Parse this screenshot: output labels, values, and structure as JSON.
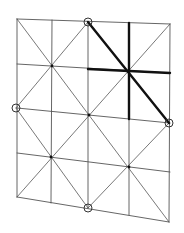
{
  "diagram": {
    "width": 184,
    "height": 233,
    "colors": {
      "background": "#ffffff",
      "thin_line": "#555555",
      "thick_line": "#111111",
      "marker": "#333333"
    },
    "grid_lines": [
      {
        "name": "row-0",
        "x1": 17,
        "y1": 19,
        "x2": 170,
        "y2": 24
      },
      {
        "name": "row-1",
        "x1": 17,
        "y1": 64,
        "x2": 170,
        "y2": 73
      },
      {
        "name": "row-2",
        "x1": 17,
        "y1": 108,
        "x2": 170,
        "y2": 123
      },
      {
        "name": "row-3",
        "x1": 17,
        "y1": 153,
        "x2": 170,
        "y2": 172
      },
      {
        "name": "row-4",
        "x1": 17,
        "y1": 197,
        "x2": 169,
        "y2": 222
      },
      {
        "name": "col-0",
        "x1": 17,
        "y1": 19,
        "x2": 17,
        "y2": 197
      },
      {
        "name": "col-1",
        "x1": 52,
        "y1": 20,
        "x2": 51,
        "y2": 203
      },
      {
        "name": "col-2",
        "x1": 88,
        "y1": 22,
        "x2": 88,
        "y2": 208
      },
      {
        "name": "col-3",
        "x1": 129,
        "y1": 23,
        "x2": 129,
        "y2": 215
      },
      {
        "name": "col-4",
        "x1": 170,
        "y1": 24,
        "x2": 169,
        "y2": 222
      }
    ],
    "diagonal_lines": [
      {
        "name": "diag-main-down",
        "x1": 17,
        "y1": 19,
        "x2": 169,
        "y2": 222
      },
      {
        "name": "diag-main-up",
        "x1": 170,
        "y1": 24,
        "x2": 17,
        "y2": 197
      },
      {
        "name": "diag-top-left",
        "x1": 88,
        "y1": 22,
        "x2": 16,
        "y2": 108
      },
      {
        "name": "diag-top-right",
        "x1": 88,
        "y1": 22,
        "x2": 169,
        "y2": 123
      },
      {
        "name": "diag-bottom-left",
        "x1": 16,
        "y1": 108,
        "x2": 88,
        "y2": 208
      },
      {
        "name": "diag-bottom-right",
        "x1": 88,
        "y1": 208,
        "x2": 169,
        "y2": 123
      }
    ],
    "thick_lines": [
      {
        "name": "thick-diagonal",
        "x1": 88,
        "y1": 22,
        "x2": 169,
        "y2": 123
      },
      {
        "name": "thick-vertical",
        "x1": 129,
        "y1": 23,
        "x2": 129,
        "y2": 119
      },
      {
        "name": "thick-horizontal",
        "x1": 88,
        "y1": 69,
        "x2": 170,
        "y2": 73
      }
    ],
    "circle_markers": [
      {
        "name": "marker-top",
        "cx": 88,
        "cy": 22,
        "r": 4
      },
      {
        "name": "marker-left",
        "cx": 16,
        "cy": 108,
        "r": 4
      },
      {
        "name": "marker-right",
        "cx": 169,
        "cy": 123,
        "r": 4
      },
      {
        "name": "marker-bottom",
        "cx": 88,
        "cy": 208,
        "r": 4
      }
    ],
    "vertex_dots": [
      {
        "name": "node-1-1",
        "cx": 52,
        "cy": 66
      },
      {
        "name": "node-3-1",
        "cx": 129,
        "cy": 71
      },
      {
        "name": "node-2-2",
        "cx": 89,
        "cy": 115
      },
      {
        "name": "node-1-3",
        "cx": 51,
        "cy": 157
      },
      {
        "name": "node-3-3",
        "cx": 129,
        "cy": 167
      }
    ]
  }
}
